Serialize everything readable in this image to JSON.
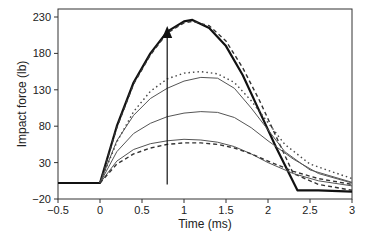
{
  "chart_data": {
    "type": "line",
    "title": "",
    "xlabel": "Time (ms)",
    "ylabel": "Impact force (lb)",
    "xlim": [
      -0.5,
      3
    ],
    "ylim": [
      -20,
      230
    ],
    "xticks": [
      "−0.5",
      "0",
      "0.5",
      "1",
      "1.5",
      "2",
      "2.5",
      "3"
    ],
    "yticks": [
      "−20",
      "30",
      "80",
      "130",
      "180",
      "230"
    ],
    "grid": false,
    "legend": null,
    "annotations": [
      {
        "type": "arrow",
        "from": [
          0.8,
          0
        ],
        "to": [
          0.8,
          215
        ],
        "meaning": "increasing impact"
      }
    ],
    "series": [
      {
        "name": "measured-1",
        "style": "thick-solid",
        "x": [
          -0.5,
          0,
          0.2,
          0.4,
          0.6,
          0.8,
          1.0,
          1.1,
          1.3,
          1.5,
          1.7,
          1.9,
          2.1,
          2.35,
          2.6,
          3
        ],
        "values": [
          2,
          2,
          80,
          140,
          180,
          210,
          224,
          226,
          215,
          190,
          150,
          100,
          50,
          -8,
          -8,
          -10
        ]
      },
      {
        "name": "model-1",
        "style": "dashed",
        "x": [
          0,
          0.2,
          0.4,
          0.6,
          0.8,
          1.0,
          1.1,
          1.3,
          1.5,
          1.7,
          1.9,
          2.1,
          2.3,
          2.6,
          3
        ],
        "values": [
          2,
          78,
          138,
          178,
          208,
          222,
          224,
          218,
          197,
          160,
          115,
          65,
          15,
          0,
          -8
        ]
      },
      {
        "name": "measured-2",
        "style": "thin-solid",
        "x": [
          0,
          0.2,
          0.4,
          0.6,
          0.8,
          1.0,
          1.2,
          1.4,
          1.6,
          1.8,
          2.0,
          2.2,
          2.5,
          3
        ],
        "values": [
          2,
          60,
          95,
          118,
          132,
          142,
          147,
          146,
          132,
          105,
          75,
          45,
          20,
          3
        ]
      },
      {
        "name": "model-2",
        "style": "dotted",
        "x": [
          0,
          0.2,
          0.4,
          0.6,
          0.8,
          1.0,
          1.2,
          1.4,
          1.6,
          1.8,
          2.0,
          2.2,
          2.5,
          3
        ],
        "values": [
          2,
          58,
          100,
          128,
          145,
          153,
          155,
          152,
          140,
          115,
          85,
          55,
          28,
          8
        ]
      },
      {
        "name": "measured-3",
        "style": "thin-solid",
        "x": [
          0,
          0.2,
          0.4,
          0.6,
          0.8,
          1.0,
          1.2,
          1.4,
          1.6,
          1.8,
          2.0,
          2.3,
          2.6,
          3
        ],
        "values": [
          2,
          45,
          70,
          84,
          93,
          98,
          100,
          99,
          92,
          78,
          60,
          35,
          15,
          2
        ]
      },
      {
        "name": "measured-4",
        "style": "thin-solid",
        "x": [
          0,
          0.2,
          0.4,
          0.6,
          0.8,
          1.0,
          1.2,
          1.4,
          1.6,
          1.8,
          2.0,
          2.3,
          2.6,
          3
        ],
        "values": [
          2,
          32,
          48,
          56,
          60,
          62,
          61,
          58,
          52,
          42,
          30,
          15,
          5,
          -2
        ]
      },
      {
        "name": "model-4",
        "style": "dashed",
        "x": [
          0,
          0.2,
          0.4,
          0.6,
          0.8,
          1.0,
          1.2,
          1.4,
          1.6,
          1.8,
          2.0,
          2.3,
          2.6,
          3
        ],
        "values": [
          2,
          28,
          42,
          50,
          55,
          57,
          57,
          55,
          50,
          42,
          32,
          18,
          8,
          0
        ]
      }
    ]
  }
}
